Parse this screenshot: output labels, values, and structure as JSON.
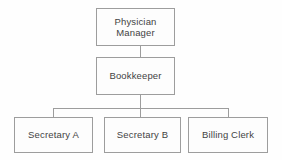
{
  "diagram": {
    "type": "org-chart",
    "orientation": "top-down",
    "levels": 3,
    "colors": {
      "background": "#fefefe",
      "node_fill": "#fdfdfd",
      "node_border": "#9d9d9d",
      "connector": "#9d9d9d",
      "text": "#434343"
    },
    "nodes": {
      "physician_manager": {
        "label": "Physician\nManager",
        "level": 1
      },
      "bookkeeper": {
        "label": "Bookkeeper",
        "level": 2
      },
      "secretary_a": {
        "label": "Secretary A",
        "level": 3
      },
      "secretary_b": {
        "label": "Secretary B",
        "level": 3
      },
      "billing_clerk": {
        "label": "Billing Clerk",
        "level": 3
      }
    },
    "edges": [
      {
        "from": "physician_manager",
        "to": "bookkeeper"
      },
      {
        "from": "bookkeeper",
        "to": "secretary_a"
      },
      {
        "from": "bookkeeper",
        "to": "secretary_b"
      },
      {
        "from": "bookkeeper",
        "to": "billing_clerk"
      }
    ]
  }
}
